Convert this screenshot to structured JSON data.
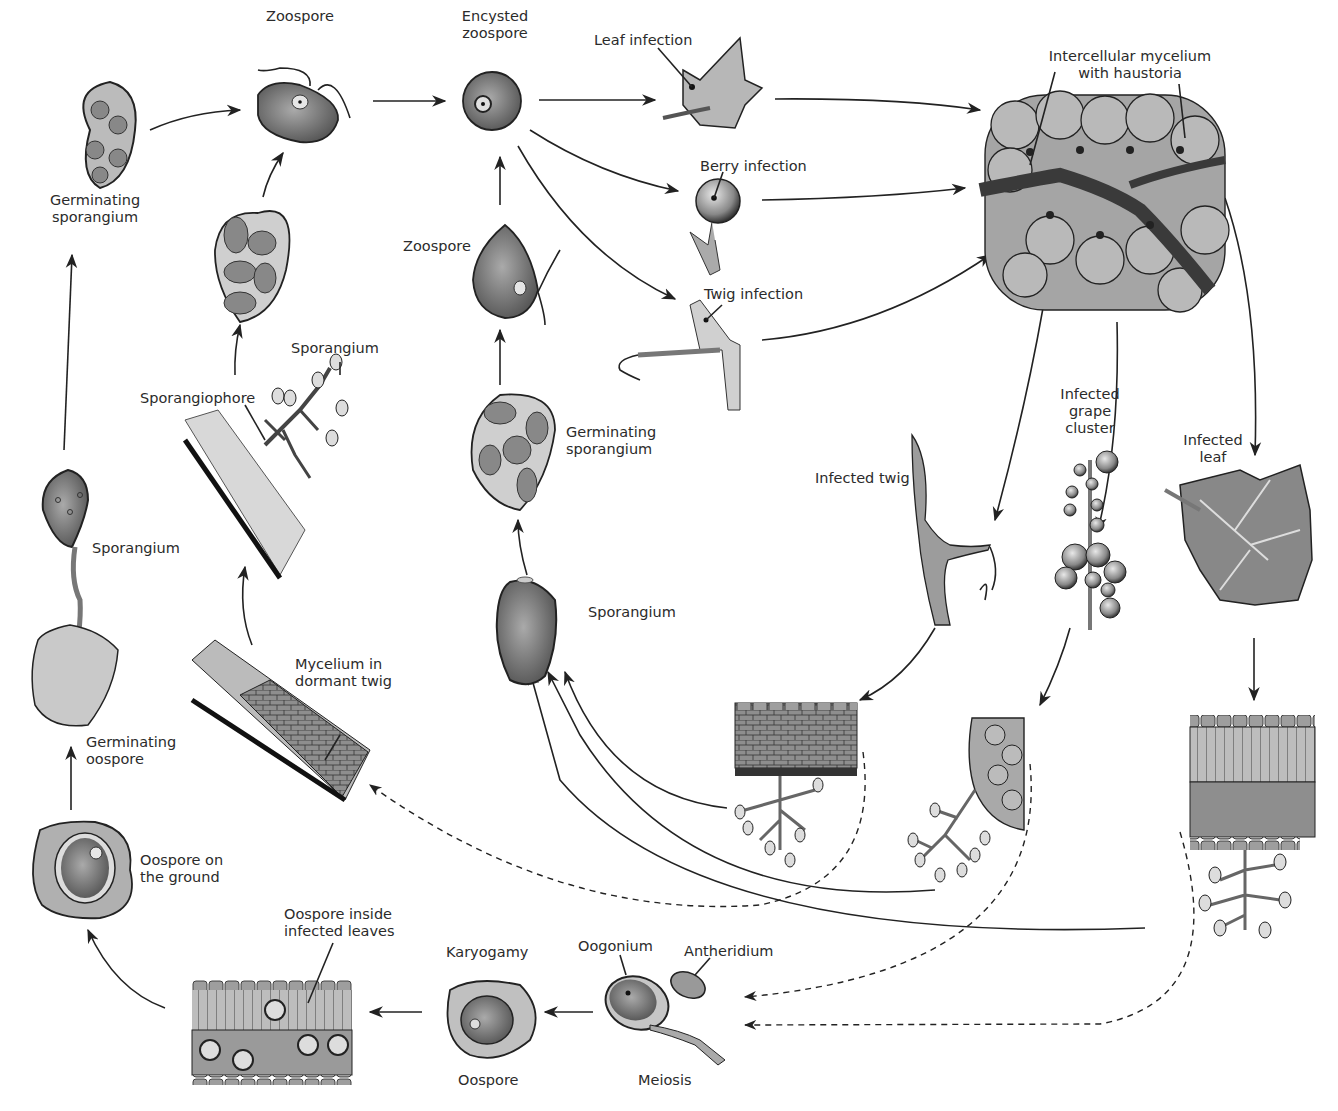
{
  "colors": {
    "background": "#ffffff",
    "ink": "#222222",
    "cell_fill": "#9a9a9a",
    "light_fill": "#d4d4d4",
    "dark_fill": "#555555"
  },
  "labels": {
    "zoospore_top": "Zoospore",
    "encysted_zoospore": [
      "Encysted",
      "zoospore"
    ],
    "leaf_infection": "Leaf infection",
    "berry_infection": "Berry infection",
    "twig_infection": "Twig infection",
    "intercellular_mycelium": [
      "Intercellular mycelium",
      "with haustoria"
    ],
    "germinating_sporangium_left": [
      "Germinating",
      "sporangium"
    ],
    "zoospore_mid": "Zoospore",
    "sporangium_upper": "Sporangium",
    "sporangiophore": "Sporangiophore",
    "germinating_sporangium_mid": [
      "Germinating",
      "sporangium"
    ],
    "infected_twig": "Infected twig",
    "infected_grape_cluster": [
      "Infected",
      "grape",
      "cluster"
    ],
    "infected_leaf": [
      "Infected",
      "leaf"
    ],
    "sporangium_left": "Sporangium",
    "sporangium_center": "Sporangium",
    "mycelium_dormant_twig": [
      "Mycelium in",
      "dormant twig"
    ],
    "germinating_oospore": [
      "Germinating",
      "oospore"
    ],
    "oospore_on_ground": [
      "Oospore on",
      "the ground"
    ],
    "oospore_inside_leaves": [
      "Oospore inside",
      "infected leaves"
    ],
    "karyogamy": "Karyogamy",
    "oospore_bottom": "Oospore",
    "oogonium": "Oogonium",
    "antheridium": "Antheridium",
    "meiosis": "Meiosis"
  }
}
